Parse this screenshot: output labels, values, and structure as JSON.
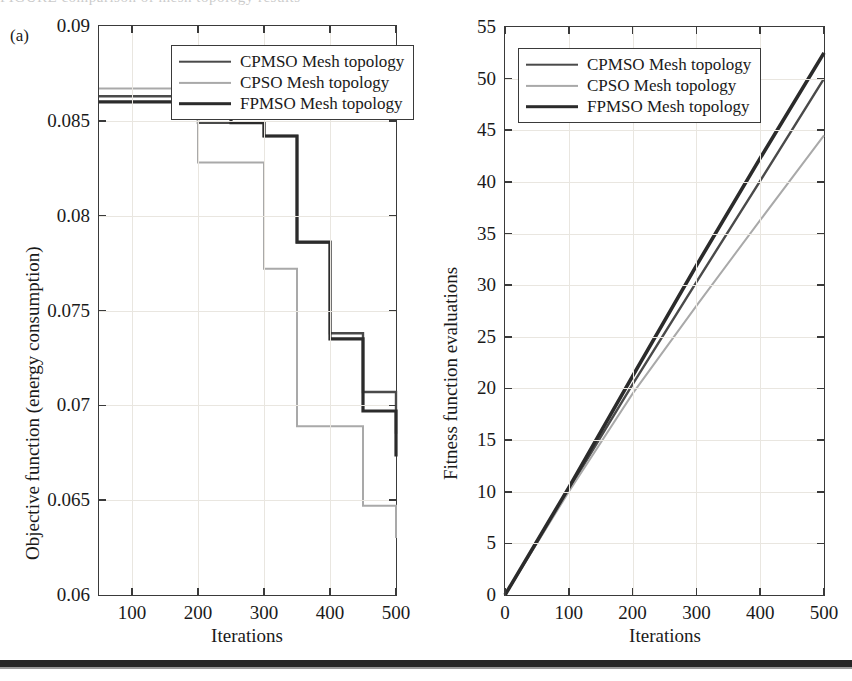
{
  "figure": {
    "panel_label": "(a)",
    "top_cutoff_text": "FIGURE  comparison of mesh topology results",
    "series_colors": {
      "CPMSO": "#4a4a4a",
      "CPSO": "#a9a9a9",
      "FPMSO": "#2b2b2b"
    }
  },
  "chart_data": [
    {
      "type": "line",
      "id": "objective-function-chart",
      "title": "",
      "xlabel": "Iterations",
      "ylabel": "Objective function (energy consumption)",
      "xlim": [
        50,
        500
      ],
      "ylim": [
        0.06,
        0.09
      ],
      "xticks": [
        100,
        200,
        300,
        400,
        500
      ],
      "yticks": [
        0.06,
        0.065,
        0.07,
        0.075,
        0.08,
        0.085,
        0.09
      ],
      "ytick_labels": [
        "0.06",
        "0.065",
        "0.07",
        "0.075",
        "0.08",
        "0.085",
        "0.09"
      ],
      "xtick_labels": [
        "100",
        "200",
        "300",
        "400",
        "500"
      ],
      "grid": true,
      "drawstyle": "steps-post",
      "legend_position": "upper right",
      "legend": [
        "CPMSO Mesh topology",
        "CPSO Mesh topology",
        "FPMSO Mesh topology"
      ],
      "x": [
        50,
        100,
        150,
        200,
        250,
        300,
        350,
        400,
        450,
        500
      ],
      "series": [
        {
          "name": "CPMSO Mesh topology",
          "color": "#4a4a4a",
          "width": 2.4,
          "values": [
            0.0863,
            0.0863,
            0.0863,
            0.0849,
            0.0849,
            0.0842,
            0.0786,
            0.0738,
            0.0707,
            0.0685
          ]
        },
        {
          "name": "CPSO Mesh topology",
          "color": "#a9a9a9",
          "width": 2.0,
          "values": [
            0.0867,
            0.0867,
            0.0867,
            0.0828,
            0.0828,
            0.0772,
            0.0689,
            0.0689,
            0.0647,
            0.063
          ]
        },
        {
          "name": "FPMSO Mesh topology",
          "color": "#2b2b2b",
          "width": 3.2,
          "values": [
            0.086,
            0.086,
            0.086,
            0.086,
            0.0849,
            0.0842,
            0.0786,
            0.0735,
            0.0697,
            0.0673
          ]
        }
      ]
    },
    {
      "type": "line",
      "id": "fitness-evaluations-chart",
      "title": "",
      "xlabel": "Iterations",
      "ylabel": "Fitness function evaluations",
      "xlim": [
        0,
        500
      ],
      "ylim": [
        0,
        55
      ],
      "xticks": [
        0,
        100,
        200,
        300,
        400,
        500
      ],
      "yticks": [
        0,
        5,
        10,
        15,
        20,
        25,
        30,
        35,
        40,
        45,
        50,
        55
      ],
      "ytick_labels": [
        "0",
        "5",
        "10",
        "15",
        "20",
        "25",
        "30",
        "35",
        "40",
        "45",
        "50",
        "55"
      ],
      "xtick_labels": [
        "0",
        "100",
        "200",
        "300",
        "400",
        "500"
      ],
      "grid": true,
      "drawstyle": "linear",
      "legend_position": "upper left",
      "legend": [
        "CPMSO Mesh topology",
        "CPSO Mesh topology",
        "FPMSO Mesh topology"
      ],
      "x": [
        0,
        100,
        200,
        300,
        400,
        500
      ],
      "series": [
        {
          "name": "CPMSO Mesh topology",
          "color": "#4a4a4a",
          "width": 2.4,
          "values": [
            0,
            10.2,
            20.4,
            30.3,
            40.1,
            50.0
          ]
        },
        {
          "name": "CPSO Mesh topology",
          "color": "#a9a9a9",
          "width": 2.0,
          "values": [
            0,
            10.0,
            19.5,
            28.0,
            36.3,
            44.5
          ]
        },
        {
          "name": "FPMSO Mesh topology",
          "color": "#2b2b2b",
          "width": 3.6,
          "values": [
            0,
            10.4,
            21.2,
            31.9,
            42.3,
            52.5
          ]
        }
      ]
    }
  ]
}
